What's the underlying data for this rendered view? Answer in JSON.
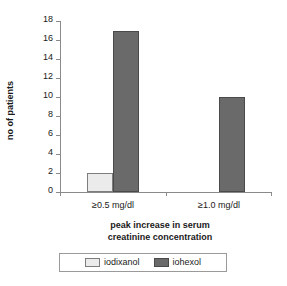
{
  "chart_data": {
    "type": "bar",
    "title": "",
    "subtitle": "",
    "xlabel": "peak increase in serum creatinine concentration",
    "xlabel_lines": [
      "peak increase in serum",
      "creatinine concentration"
    ],
    "ylabel": "no of patients",
    "categories": [
      "≥0.5 mg/dl",
      "≥1.0 mg/dl"
    ],
    "series": [
      {
        "name": "iodixanol",
        "values": [
          2,
          0
        ],
        "color": "#ebebeb"
      },
      {
        "name": "iohexol",
        "values": [
          17,
          10
        ],
        "color": "#6a6a6a"
      }
    ],
    "ylim": [
      0,
      18
    ],
    "ytick_step": 2,
    "ytick_labels": [
      "18",
      "16",
      "14",
      "12",
      "10",
      "8",
      "6",
      "4",
      "2",
      "0"
    ],
    "ytick_values": [
      18,
      16,
      14,
      12,
      10,
      8,
      6,
      4,
      2,
      0
    ],
    "grid": false,
    "legend_position": "bottom",
    "legend_entries": [
      "iodixanol",
      "iohexol"
    ],
    "axis_color": "#8a8a8a",
    "text_color": "#1a1a1a"
  }
}
